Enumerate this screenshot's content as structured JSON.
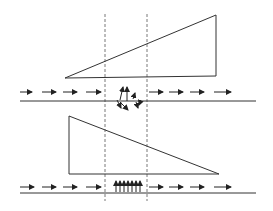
{
  "diagram": {
    "colors": {
      "stroke": "#333333",
      "dashed": "#555555",
      "background": "#ffffff"
    },
    "zone": {
      "left_x": 105,
      "right_x": 147,
      "top_y": 14,
      "bottom_y": 201
    },
    "top_panel": {
      "triangle": [
        [
          65,
          78
        ],
        [
          216,
          15
        ],
        [
          216,
          76
        ]
      ],
      "baseline": {
        "x1": 20,
        "x2": 256,
        "y": 101
      },
      "flow_y": 92,
      "left_arrows": [
        [
          20,
          32
        ],
        [
          42,
          56
        ],
        [
          63,
          77
        ],
        [
          86,
          101
        ]
      ],
      "right_arrows": [
        [
          149,
          163
        ],
        [
          169,
          183
        ],
        [
          190,
          204
        ],
        [
          214,
          231
        ]
      ],
      "scattered_arrows": [
        [
          [
            120,
            100
          ],
          [
            123,
            87
          ]
        ],
        [
          [
            127,
            101
          ],
          [
            127,
            87
          ]
        ],
        [
          [
            133,
            99
          ],
          [
            135,
            93
          ]
        ],
        [
          [
            117,
            100
          ],
          [
            121,
            108
          ]
        ],
        [
          [
            120,
            102
          ],
          [
            128,
            110
          ]
        ],
        [
          [
            136,
            102
          ],
          [
            138,
            108
          ]
        ],
        [
          [
            141,
            100
          ],
          [
            139,
            105
          ]
        ]
      ]
    },
    "bottom_panel": {
      "triangle": [
        [
          69,
          116
        ],
        [
          69,
          174
        ],
        [
          219,
          174
        ]
      ],
      "baseline": {
        "x1": 20,
        "x2": 256,
        "y": 193
      },
      "flow_y": 187,
      "left_arrows": [
        [
          20,
          34
        ],
        [
          42,
          56
        ],
        [
          63,
          77
        ],
        [
          86,
          101
        ]
      ],
      "right_arrows": [
        [
          149,
          163
        ],
        [
          169,
          183
        ],
        [
          190,
          204
        ],
        [
          214,
          231
        ]
      ],
      "vertical_arrows_x": [
        116,
        120,
        124,
        128,
        132,
        136,
        140
      ],
      "vertical_arrows_y": [
        192,
        181
      ]
    }
  }
}
